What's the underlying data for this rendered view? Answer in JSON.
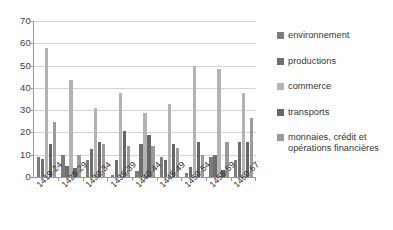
{
  "chart_data": {
    "type": "bar",
    "title": "",
    "subtitle": "",
    "xlabel": "",
    "ylabel": "",
    "ylim": [
      0,
      70
    ],
    "ytick_step": 10,
    "yticks": [
      70,
      60,
      50,
      40,
      30,
      20,
      10,
      0
    ],
    "grid": true,
    "legend_position": "right",
    "categories": [
      "1419-24",
      "1425-29",
      "1430-34",
      "1435-39",
      "1440-44",
      "1445-49",
      "1450-54",
      "1455-59",
      "1460-67"
    ],
    "series": [
      {
        "name": "environnement",
        "color": "#7c7c7c",
        "values": [
          9.0,
          9.8,
          7.8,
          1.0,
          2.6,
          9.0,
          1.6,
          8.8,
          7.6
        ]
      },
      {
        "name": "productions",
        "color": "#6e6e6e",
        "values": [
          8.1,
          4.8,
          12.6,
          7.8,
          14.7,
          7.8,
          4.5,
          9.8,
          15.7
        ]
      },
      {
        "name": "commerce",
        "color": "#b3b3b3",
        "values": [
          57.9,
          43.6,
          30.8,
          37.8,
          28.8,
          32.6,
          49.6,
          48.6,
          37.6
        ]
      },
      {
        "name": "transports",
        "color": "#666666",
        "values": [
          14.8,
          3.9,
          15.8,
          20.8,
          18.7,
          14.7,
          15.8,
          3.2,
          15.6
        ]
      },
      {
        "name": "monnaies, crédit et opérations financières",
        "color": "#9a9a9a",
        "values": [
          24.8,
          9.8,
          14.8,
          13.8,
          13.8,
          12.9,
          9.8,
          15.7,
          26.6
        ]
      }
    ]
  },
  "legend": {
    "items": [
      {
        "label": "environnement"
      },
      {
        "label": "productions"
      },
      {
        "label": "commerce"
      },
      {
        "label": "transports"
      },
      {
        "label": "monnaies, crédit et opérations financières"
      }
    ]
  }
}
